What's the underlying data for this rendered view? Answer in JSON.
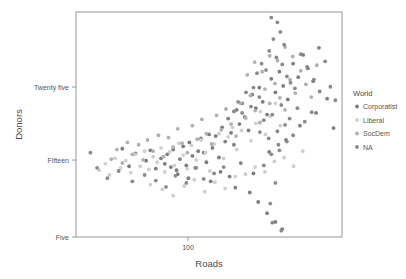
{
  "chart_data": {
    "type": "scatter",
    "title": "",
    "xlabel": "Roads",
    "ylabel": "Donors",
    "xscale": "log",
    "yscale": "linear",
    "grid": false,
    "xticks": [
      {
        "value": 100,
        "label": "100",
        "px": 188
      }
    ],
    "yticks": [
      {
        "value": 25,
        "label": "Twenty five",
        "px": 87
      },
      {
        "value": 15,
        "label": "Fifteen",
        "px": 160
      },
      {
        "value": 5,
        "label": "Five",
        "px": 237
      }
    ],
    "xlim": [
      48,
      420
    ],
    "ylim": [
      4.2,
      32.5
    ],
    "legend": {
      "title": "World",
      "position": "right",
      "entries": [
        {
          "label": "Corporatist",
          "color": "#7d7d7d"
        },
        {
          "label": "Liberal",
          "color": "#cfcfcf"
        },
        {
          "label": "SocDem",
          "color": "#b0b0b0"
        },
        {
          "label": "NA",
          "color": "#8a8a8a"
        }
      ]
    },
    "series": [
      {
        "name": "Corporatist",
        "color": "#7d7d7d",
        "points": [
          [
            96,
            14.1
          ],
          [
            99,
            13.4
          ],
          [
            101,
            14.6
          ],
          [
            104,
            13.0
          ],
          [
            106,
            15.2
          ],
          [
            109,
            12.6
          ],
          [
            112,
            14.0
          ],
          [
            115,
            15.6
          ],
          [
            118,
            13.2
          ],
          [
            121,
            16.1
          ],
          [
            124,
            14.4
          ],
          [
            127,
            12.9
          ],
          [
            130,
            15.0
          ],
          [
            133,
            16.6
          ],
          [
            136,
            14.8
          ],
          [
            139,
            13.6
          ],
          [
            142,
            17.1
          ],
          [
            146,
            15.4
          ],
          [
            150,
            16.9
          ],
          [
            154,
            14.2
          ],
          [
            158,
            18.0
          ],
          [
            162,
            16.2
          ],
          [
            166,
            19.1
          ],
          [
            170,
            17.3
          ],
          [
            174,
            15.8
          ],
          [
            178,
            20.2
          ],
          [
            182,
            18.4
          ],
          [
            186,
            21.0
          ],
          [
            190,
            19.3
          ],
          [
            196,
            17.6
          ],
          [
            202,
            22.1
          ],
          [
            208,
            20.4
          ],
          [
            214,
            23.0
          ],
          [
            220,
            21.2
          ],
          [
            228,
            19.6
          ],
          [
            236,
            24.1
          ],
          [
            244,
            22.4
          ],
          [
            252,
            25.0
          ],
          [
            260,
            23.2
          ],
          [
            270,
            21.5
          ],
          [
            282,
            26.0
          ],
          [
            294,
            24.3
          ],
          [
            306,
            27.1
          ],
          [
            318,
            25.4
          ],
          [
            332,
            23.8
          ],
          [
            348,
            28.0
          ],
          [
            156,
            12.4
          ],
          [
            168,
            11.8
          ],
          [
            184,
            13.5
          ],
          [
            204,
            12.2
          ],
          [
            232,
            14.9
          ],
          [
            266,
            16.4
          ],
          [
            298,
            18.2
          ],
          [
            340,
            19.8
          ],
          [
            372,
            21.6
          ],
          [
            392,
            17.9
          ],
          [
            120,
            11.6
          ],
          [
            110,
            12.1
          ],
          [
            144,
            11.2
          ],
          [
            176,
            10.4
          ],
          [
            198,
            9.8
          ],
          [
            212,
            8.6
          ],
          [
            228,
            7.2
          ],
          [
            244,
            6.1
          ],
          [
            258,
            5.2
          ],
          [
            85,
            13.8
          ],
          [
            88,
            15.1
          ],
          [
            92,
            12.8
          ],
          [
            78,
            14.7
          ],
          [
            74,
            13.1
          ],
          [
            70,
            15.3
          ]
        ]
      },
      {
        "name": "Liberal",
        "color": "#cfcfcf",
        "points": [
          [
            58,
            12.6
          ],
          [
            61,
            13.4
          ],
          [
            63,
            12.0
          ],
          [
            66,
            14.1
          ],
          [
            69,
            12.9
          ],
          [
            72,
            13.8
          ],
          [
            75,
            12.3
          ],
          [
            78,
            14.6
          ],
          [
            81,
            13.1
          ],
          [
            84,
            15.0
          ],
          [
            87,
            12.7
          ],
          [
            90,
            14.3
          ],
          [
            93,
            13.6
          ],
          [
            96,
            15.4
          ],
          [
            99,
            12.4
          ],
          [
            103,
            14.9
          ],
          [
            107,
            13.2
          ],
          [
            111,
            16.0
          ],
          [
            115,
            14.5
          ],
          [
            119,
            12.8
          ],
          [
            123,
            15.7
          ],
          [
            128,
            13.9
          ],
          [
            133,
            16.4
          ],
          [
            138,
            14.8
          ],
          [
            143,
            12.5
          ],
          [
            148,
            15.9
          ],
          [
            154,
            17.2
          ],
          [
            160,
            14.1
          ],
          [
            166,
            16.8
          ],
          [
            172,
            18.0
          ],
          [
            178,
            15.2
          ],
          [
            185,
            17.6
          ],
          [
            192,
            19.1
          ],
          [
            200,
            16.3
          ],
          [
            208,
            18.5
          ],
          [
            216,
            20.0
          ],
          [
            225,
            17.1
          ],
          [
            234,
            19.4
          ],
          [
            244,
            21.0
          ],
          [
            254,
            18.2
          ],
          [
            88,
            10.8
          ],
          [
            97,
            10.2
          ],
          [
            106,
            9.4
          ],
          [
            116,
            10.6
          ],
          [
            126,
            11.4
          ],
          [
            137,
            9.9
          ],
          [
            149,
            11.1
          ],
          [
            162,
            10.3
          ],
          [
            176,
            11.8
          ],
          [
            191,
            12.1
          ],
          [
            207,
            13.0
          ],
          [
            224,
            12.4
          ],
          [
            242,
            13.7
          ],
          [
            262,
            14.2
          ],
          [
            283,
            13.1
          ],
          [
            305,
            15.0
          ]
        ]
      },
      {
        "name": "SocDem",
        "color": "#b0b0b0",
        "points": [
          [
            64,
            14.0
          ],
          [
            67,
            15.2
          ],
          [
            70,
            13.5
          ],
          [
            73,
            16.1
          ],
          [
            76,
            14.6
          ],
          [
            80,
            15.8
          ],
          [
            83,
            13.9
          ],
          [
            86,
            16.4
          ],
          [
            90,
            15.0
          ],
          [
            94,
            17.0
          ],
          [
            98,
            14.3
          ],
          [
            102,
            16.7
          ],
          [
            106,
            15.5
          ],
          [
            110,
            17.8
          ],
          [
            114,
            16.0
          ],
          [
            119,
            14.8
          ],
          [
            124,
            18.2
          ],
          [
            129,
            16.5
          ],
          [
            134,
            19.0
          ],
          [
            139,
            17.2
          ],
          [
            145,
            15.9
          ],
          [
            151,
            19.5
          ],
          [
            157,
            17.7
          ],
          [
            163,
            20.3
          ],
          [
            170,
            18.4
          ],
          [
            177,
            16.9
          ],
          [
            184,
            21.0
          ],
          [
            191,
            19.2
          ],
          [
            199,
            22.0
          ],
          [
            207,
            20.1
          ],
          [
            215,
            18.6
          ],
          [
            224,
            22.8
          ],
          [
            233,
            21.0
          ],
          [
            243,
            23.5
          ],
          [
            253,
            21.7
          ],
          [
            264,
            20.2
          ],
          [
            275,
            24.0
          ],
          [
            287,
            22.3
          ],
          [
            300,
            25.1
          ],
          [
            313,
            23.4
          ],
          [
            327,
            21.8
          ],
          [
            342,
            25.8
          ],
          [
            194,
            24.6
          ],
          [
            206,
            26.2
          ],
          [
            219,
            25.0
          ],
          [
            233,
            27.0
          ],
          [
            248,
            26.4
          ],
          [
            264,
            28.1
          ],
          [
            281,
            26.9
          ]
        ]
      },
      {
        "name": "NA",
        "color": "#8a8a8a",
        "points": [
          [
            236,
            31.8
          ],
          [
            248,
            31.2
          ],
          [
            254,
            30.0
          ],
          [
            240,
            29.1
          ],
          [
            262,
            28.4
          ],
          [
            232,
            27.6
          ],
          [
            246,
            26.8
          ],
          [
            258,
            25.9
          ],
          [
            226,
            25.2
          ],
          [
            268,
            24.4
          ],
          [
            218,
            26.0
          ],
          [
            276,
            23.6
          ],
          [
            210,
            24.8
          ],
          [
            286,
            22.9
          ],
          [
            300,
            27.2
          ],
          [
            316,
            25.6
          ],
          [
            334,
            24.0
          ],
          [
            350,
            22.5
          ],
          [
            366,
            26.3
          ],
          [
            382,
            23.1
          ],
          [
            398,
            21.4
          ],
          [
            204,
            23.0
          ],
          [
            214,
            21.8
          ],
          [
            200,
            20.6
          ],
          [
            192,
            22.4
          ],
          [
            186,
            19.8
          ],
          [
            180,
            21.2
          ],
          [
            174,
            20.0
          ],
          [
            222,
            18.9
          ],
          [
            238,
            19.6
          ],
          [
            256,
            20.8
          ],
          [
            274,
            19.1
          ],
          [
            292,
            20.4
          ],
          [
            310,
            18.7
          ],
          [
            328,
            19.9
          ],
          [
            248,
            17.5
          ],
          [
            264,
            18.3
          ],
          [
            282,
            17.0
          ],
          [
            231,
            16.6
          ],
          [
            215,
            17.4
          ],
          [
            250,
            15.8
          ],
          [
            268,
            16.2
          ],
          [
            236,
            14.6
          ],
          [
            252,
            15.1
          ],
          [
            222,
            13.2
          ],
          [
            244,
            11.0
          ],
          [
            234,
            8.4
          ],
          [
            238,
            6.0
          ],
          [
            256,
            5.0
          ],
          [
            160,
            13.0
          ],
          [
            148,
            12.2
          ],
          [
            136,
            11.5
          ],
          [
            128,
            12.9
          ],
          [
            118,
            11.0
          ],
          [
            108,
            11.9
          ],
          [
            100,
            10.5
          ],
          [
            92,
            11.3
          ],
          [
            84,
            12.0
          ],
          [
            76,
            11.2
          ],
          [
            68,
            12.5
          ],
          [
            62,
            11.6
          ],
          [
            57,
            12.9
          ],
          [
            54,
            14.8
          ]
        ]
      }
    ]
  }
}
